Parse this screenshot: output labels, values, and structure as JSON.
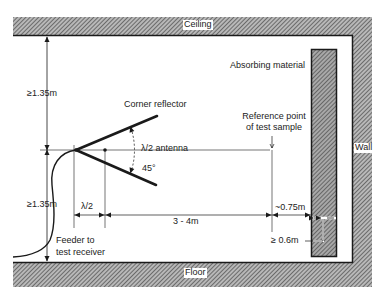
{
  "diagram": {
    "type": "antenna test setup cross-section",
    "colors": {
      "background": "#ffffff",
      "line": "#1a1a1a",
      "hatch_dark": "#555555",
      "hatch_light": "#bbbbbb",
      "text": "#222222"
    },
    "surfaces": {
      "ceiling": "Ceiling",
      "floor": "Floor",
      "wall": "Wall"
    },
    "components": {
      "absorber": "Absorbing material",
      "reflector": "Corner reflector",
      "antenna": "λ/2 antenna",
      "angle": "45°",
      "reference_line1": "Reference point",
      "reference_line2": "of test sample",
      "reference_mark": "×",
      "feeder_line1": "Feeder to",
      "feeder_line2": "test receiver"
    },
    "dimensions": {
      "to_ceiling": "≥1.35m",
      "to_floor": "≥1.35m",
      "antenna_spacing": "λ/2",
      "distance_to_sample": "3 - 4m",
      "sample_to_absorber": "~0.75m",
      "absorber_thickness": "≥ 0.6m"
    }
  }
}
